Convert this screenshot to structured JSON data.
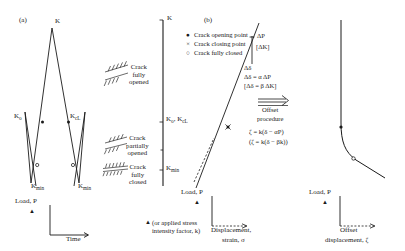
{
  "figure": {
    "panel_a_tag": "(a)",
    "panel_b_tag": "(b)"
  },
  "panel_a": {
    "y_axis_label": "K",
    "x_axis_label": "Time",
    "load_axis_label": "Load, P",
    "load_axis_marker": "▲",
    "peak_label": "K",
    "open_label": "K",
    "open_sub": "o",
    "close_label": "K",
    "close_sub": "cL",
    "min_label": "K",
    "min_sub": "min",
    "footnote_marker": "▲",
    "footnote_line1": "(or applied stress",
    "footnote_line2": "intensity factor, k)"
  },
  "zones": [
    {
      "id": "fully-opened",
      "line1": "Crack",
      "line2": "fully",
      "line3": "opened"
    },
    {
      "id": "partially-opened",
      "line1": "Crack",
      "line2": "partially",
      "line3": "opened"
    },
    {
      "id": "fully-closed",
      "line1": "Crack",
      "line2": "fully",
      "line3": "closed"
    }
  ],
  "k_axis": {
    "title": "K",
    "tick_open_close": "K",
    "tick_open_sub": "o",
    "tick_sep": ", K",
    "tick_close_sub": "cL",
    "tick_min": "K",
    "tick_min_sub": "min"
  },
  "legend": {
    "items": [
      {
        "glyph": "●",
        "label": "Crack opening point"
      },
      {
        "glyph": "×",
        "label": "Crack closing point"
      },
      {
        "glyph": "○",
        "label": "Crack fully closed"
      }
    ]
  },
  "panel_b": {
    "delta_p": "ΔP",
    "delta_k": "[ΔK]",
    "delta_delta": "Δδ",
    "eq_alpha": "Δδ = α ΔP",
    "eq_beta": "[Δδ = β ΔK]",
    "arrow_label_line1": "Offset",
    "arrow_label_line2": "procedure",
    "eq_zeta_1": "ζ = k(δ − αP)",
    "eq_zeta_2": "(ζ = k(δ − βk))",
    "load_axis_label": "Load, P",
    "load_axis_marker": "▲",
    "x_axis_line1": "Displacement,",
    "x_axis_line2": "strain, σ"
  },
  "panel_c": {
    "load_axis_label": "Load, P",
    "load_axis_marker": "▲",
    "x_axis_line1": "Offset",
    "x_axis_line2": "displacement, ζ"
  },
  "colors": {
    "ink": "#1a1a1a",
    "background": "#ffffff"
  }
}
